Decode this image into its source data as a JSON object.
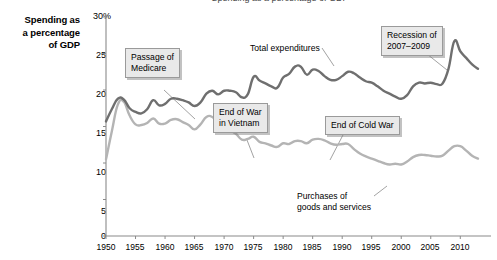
{
  "figure": {
    "background": "#ffffff",
    "partial_title": "Spending as a percentage of GDP"
  },
  "axis_title": {
    "line1": "Spending as",
    "line2": "a percentage",
    "line3": "of GDP"
  },
  "callouts": {
    "medicare": {
      "line1": "Passage of",
      "line2": "Medicare"
    },
    "vietnam": {
      "line1": "End of War",
      "line2": "in Vietnam"
    },
    "coldwar": {
      "line1": "End of Cold War"
    },
    "recession": {
      "line1": "Recession of",
      "line2": "2007–2009"
    }
  },
  "series_labels": {
    "total": "Total expenditures",
    "purchases_line1": "Purchases of",
    "purchases_line2": "goods and services"
  },
  "colors": {
    "total_expenditures": "#6f6f6f",
    "purchases": "#b4b4b4",
    "axis": "#808080",
    "callout_fill": "#e9e9e9",
    "callout_border": "#9a9a9a",
    "text": "#000000"
  },
  "chart_data": {
    "type": "line",
    "title": "Spending as a percentage of GDP",
    "xlabel": "",
    "ylabel": "Spending as a percentage of GDP",
    "xlim": [
      1950,
      2013
    ],
    "ylim": [
      0,
      30
    ],
    "ytick_labels": [
      "0",
      "5",
      "10",
      "15",
      "20",
      "25",
      "30%"
    ],
    "ytick_values": [
      0,
      5,
      10,
      15,
      20,
      25,
      30
    ],
    "xtick_labels": [
      "1950",
      "1955",
      "1960",
      "1965",
      "1970",
      "1975",
      "1980",
      "1985",
      "1990",
      "1995",
      "2000",
      "2005",
      "2010"
    ],
    "xtick_values": [
      1950,
      1955,
      1960,
      1965,
      1970,
      1975,
      1980,
      1985,
      1990,
      1995,
      2000,
      2005,
      2010
    ],
    "grid": false,
    "legend": "inline-annotations",
    "x": [
      1950,
      1951,
      1952,
      1953,
      1954,
      1955,
      1956,
      1957,
      1958,
      1959,
      1960,
      1961,
      1962,
      1963,
      1964,
      1965,
      1966,
      1967,
      1968,
      1969,
      1970,
      1971,
      1972,
      1973,
      1974,
      1975,
      1976,
      1977,
      1978,
      1979,
      1980,
      1981,
      1982,
      1983,
      1984,
      1985,
      1986,
      1987,
      1988,
      1989,
      1990,
      1991,
      1992,
      1993,
      1994,
      1995,
      1996,
      1997,
      1998,
      1999,
      2000,
      2001,
      2002,
      2003,
      2004,
      2005,
      2006,
      2007,
      2008,
      2009,
      2010,
      2011,
      2012,
      2013
    ],
    "series": [
      {
        "name": "Total expenditures",
        "color": "#6f6f6f",
        "values": [
          15.7,
          17.4,
          18.8,
          18.7,
          17.5,
          17.0,
          16.8,
          17.4,
          18.6,
          17.9,
          18.1,
          18.8,
          18.8,
          18.6,
          18.3,
          17.8,
          18.3,
          19.5,
          19.9,
          19.4,
          19.9,
          19.9,
          19.7,
          19.0,
          19.4,
          21.8,
          21.3,
          20.9,
          20.5,
          20.3,
          21.7,
          22.2,
          23.2,
          23.2,
          22.1,
          22.8,
          22.6,
          21.9,
          21.4,
          21.4,
          21.9,
          22.5,
          22.3,
          21.7,
          21.2,
          21.0,
          20.5,
          19.9,
          19.5,
          19.1,
          18.8,
          19.3,
          20.5,
          21.0,
          20.9,
          21.0,
          20.8,
          20.9,
          22.9,
          26.7,
          25.3,
          24.4,
          23.5,
          22.9
        ]
      },
      {
        "name": "Purchases of goods and services",
        "color": "#b4b4b4",
        "values": [
          10.5,
          14.4,
          18.0,
          18.4,
          16.5,
          15.3,
          15.2,
          15.5,
          16.1,
          15.4,
          15.4,
          15.9,
          16.0,
          15.6,
          15.2,
          14.6,
          15.3,
          16.3,
          16.3,
          15.5,
          15.1,
          14.5,
          14.0,
          13.2,
          13.3,
          13.6,
          12.9,
          12.7,
          12.4,
          12.2,
          12.7,
          12.6,
          13.0,
          13.0,
          12.7,
          13.2,
          13.3,
          13.1,
          12.7,
          12.5,
          12.6,
          12.6,
          11.9,
          11.3,
          10.9,
          10.6,
          10.3,
          10.0,
          9.8,
          9.9,
          9.8,
          10.2,
          10.8,
          11.1,
          11.1,
          11.0,
          10.9,
          11.0,
          11.7,
          12.3,
          12.3,
          11.7,
          11.0,
          10.6
        ]
      }
    ],
    "annotations": [
      {
        "text": "Passage of Medicare",
        "x": 1965,
        "y": 17.8
      },
      {
        "text": "End of War in Vietnam",
        "x": 1973,
        "y": 13.2
      },
      {
        "text": "End of Cold War",
        "x": 1991,
        "y": 12.6
      },
      {
        "text": "Recession of 2007–2009",
        "x": 2009,
        "y": 26.7
      },
      {
        "text": "Total expenditures",
        "x": 1984,
        "y": 22.1
      },
      {
        "text": "Purchases of goods and services",
        "x": 1997,
        "y": 10.0
      }
    ]
  }
}
